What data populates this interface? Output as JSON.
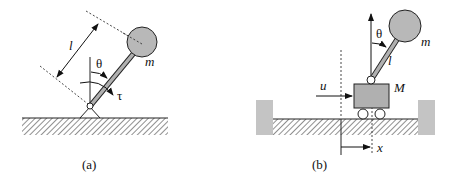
{
  "figure_a": {
    "caption": "(a)",
    "labels": {
      "length": "l",
      "angle": "θ",
      "mass": "m",
      "torque": "τ"
    },
    "colors": {
      "bob": "#b8b8b8",
      "rod": "#b0b0b0",
      "line": "#222222"
    }
  },
  "figure_b": {
    "caption": "(b)",
    "labels": {
      "angle": "θ",
      "mass": "m",
      "length": "l",
      "cart_mass": "M",
      "force": "u",
      "position": "x"
    },
    "colors": {
      "bob": "#b8b8b8",
      "cart": "#b0b0b0",
      "wall": "#c4c4c4",
      "line": "#222222"
    }
  }
}
